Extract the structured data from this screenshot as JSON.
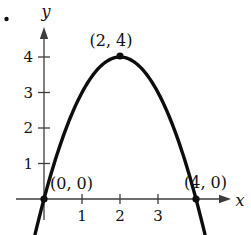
{
  "figure": {
    "problem_marker": "•"
  },
  "chart_data": {
    "type": "line",
    "title": "",
    "xlabel": "x",
    "ylabel": "y",
    "grid": false,
    "xlim": [
      -0.75,
      5.0
    ],
    "ylim": [
      -1.0,
      4.9
    ],
    "x_ticks": [
      1,
      2,
      3
    ],
    "y_ticks": [
      1,
      2,
      3,
      4
    ],
    "curve": {
      "function": "y = 4 - (x - 2)^2",
      "vertex": [
        2,
        4
      ],
      "x_intercepts": [
        [
          0,
          0
        ],
        [
          4,
          0
        ]
      ],
      "a": -1,
      "x_range": [
        -0.26,
        4.26
      ]
    },
    "points": [
      {
        "x": 0,
        "y": 0,
        "label": "(0, 0)"
      },
      {
        "x": 2,
        "y": 4,
        "label": "(2, 4)"
      },
      {
        "x": 4,
        "y": 0,
        "label": "(4, 0)"
      }
    ]
  }
}
